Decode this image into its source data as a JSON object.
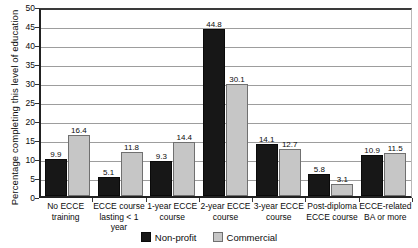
{
  "chart_data": {
    "type": "bar",
    "title": "",
    "xlabel": "",
    "ylabel": "Percentage completing this level of education",
    "ylim": [
      0,
      50
    ],
    "ytick_step": 5,
    "yticks": [
      "0",
      "5",
      "10",
      "15",
      "20",
      "25",
      "30",
      "35",
      "40",
      "45",
      "50"
    ],
    "grid": true,
    "legend_position": "bottom",
    "categories": [
      "No ECCE training",
      "ECCE course lasting < 1 year",
      "1-year ECCE course",
      "2-year ECCE course",
      "3-year ECCE course",
      "Post-diploma ECCE course",
      "ECCE-related BA or more"
    ],
    "category_lines": [
      [
        "No ECCE",
        "training"
      ],
      [
        "ECCE course",
        "lasting < 1 year"
      ],
      [
        "1-year ECCE",
        "course"
      ],
      [
        "2-year ECCE",
        "course"
      ],
      [
        "3-year ECCE",
        "course"
      ],
      [
        "Post-diploma",
        "ECCE course"
      ],
      [
        "ECCE-related",
        "BA or more"
      ]
    ],
    "series": [
      {
        "name": "Non-profit",
        "color": "#171717",
        "values": [
          9.9,
          5.1,
          9.3,
          44.8,
          14.1,
          5.8,
          10.9
        ],
        "labels": [
          "9.9",
          "5.1",
          "9.3",
          "44.8",
          "14.1",
          "5.8",
          "10.9"
        ]
      },
      {
        "name": "Commercial",
        "color": "#c6c6c6",
        "values": [
          16.4,
          11.8,
          14.4,
          30.1,
          12.7,
          3.1,
          11.5
        ],
        "labels": [
          "16.4",
          "11.8",
          "14.4",
          "30.1",
          "12.7",
          "3.1",
          "11.5"
        ]
      }
    ]
  },
  "legend": {
    "items": [
      {
        "label": "Non-profit",
        "swatch": "nonprofit"
      },
      {
        "label": "Commercial",
        "swatch": "commercial"
      }
    ]
  },
  "colors": {
    "nonprofit": "#171717",
    "commercial": "#c6c6c6",
    "gridline": "#9d9d9d",
    "axis": "#222222",
    "text": "#0b0b0b",
    "background": "#ffffff"
  }
}
